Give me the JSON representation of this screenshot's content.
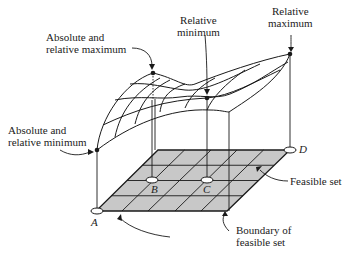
{
  "labels": {
    "abs_rel_max": [
      "Absolute and",
      "relative maximum"
    ],
    "rel_min": [
      "Relative",
      "minimum"
    ],
    "rel_max": [
      "Relative",
      "maximum"
    ],
    "abs_rel_min": [
      "Absolute and",
      "relative minimum"
    ],
    "feasible_set": "Feasible set",
    "boundary": [
      "Boundary of",
      "feasible set"
    ]
  },
  "points": {
    "A": "A",
    "B": "B",
    "C": "C",
    "D": "D"
  },
  "colors": {
    "grid_fill": "#c8c8c8",
    "line": "#1a1a1a",
    "background": "#ffffff"
  }
}
